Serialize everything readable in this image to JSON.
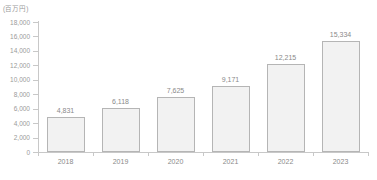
{
  "chart_data": {
    "type": "bar",
    "title": "",
    "subtitle": "",
    "unit_label": "(百万円)",
    "xlabel": "",
    "ylabel": "",
    "categories": [
      "2018",
      "2019",
      "2020",
      "2021",
      "2022",
      "2023"
    ],
    "values": [
      4831,
      6118,
      7625,
      9171,
      12215,
      15334
    ],
    "value_labels": [
      "4,831",
      "6,118",
      "7,625",
      "9,171",
      "12,215",
      "15,334"
    ],
    "ylim": [
      0,
      18000
    ],
    "ytick_values": [
      0,
      2000,
      4000,
      6000,
      8000,
      10000,
      12000,
      14000,
      16000,
      18000
    ],
    "ytick_labels": [
      "0",
      "2,000",
      "4,000",
      "6,000",
      "8,000",
      "10,000",
      "12,000",
      "14,000",
      "16,000",
      "18,000"
    ],
    "grid": false,
    "legend": false,
    "legend_position": "none",
    "colors": {
      "bar_fill": "#f2f2f2",
      "bar_border": "#b5b5b5",
      "axis": "#c8c8c8",
      "text": "#8a8a8a",
      "background": "#ffffff"
    }
  }
}
